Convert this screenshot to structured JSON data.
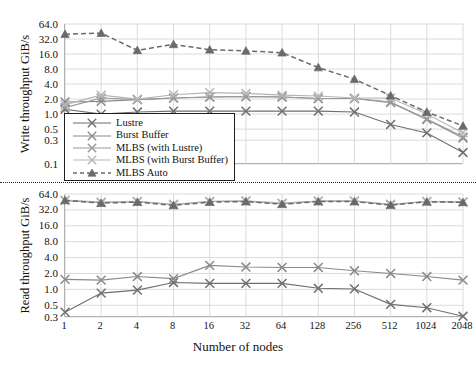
{
  "chart_data": [
    {
      "type": "line",
      "title": "",
      "xlabel": "Number of nodes",
      "ylabel": "Write throughput GiB/s",
      "xscale": "log2",
      "yscale": "log2",
      "grid": true,
      "legend_position": "inside-lower-left",
      "categories": [
        1,
        2,
        4,
        8,
        16,
        32,
        64,
        128,
        256,
        512,
        1024,
        2048
      ],
      "xtick_labels": [
        "1",
        "2",
        "4",
        "8",
        "16",
        "32",
        "64",
        "128",
        "256",
        "512",
        "1024",
        "2048"
      ],
      "ytick_labels": [
        "64.0",
        "32.0",
        "16.0",
        "8.0",
        "4.0",
        "2.0",
        "1.0",
        "0.5",
        "0.3",
        "0.1"
      ],
      "ytick_values": [
        64.0,
        32.0,
        16.0,
        8.0,
        4.0,
        2.0,
        1.0,
        0.5,
        0.3,
        0.1
      ],
      "ylim": [
        0.1,
        64.0
      ],
      "series": [
        {
          "name": "Lustre",
          "color": "#6f6f6f",
          "marker": "x",
          "dash": false,
          "values": [
            1.25,
            1.0,
            1.1,
            1.15,
            1.15,
            1.15,
            1.15,
            1.15,
            1.1,
            0.62,
            0.42,
            0.17
          ]
        },
        {
          "name": "Burst Buffer",
          "color": "#8a8a8a",
          "marker": "x",
          "dash": false,
          "values": [
            1.75,
            1.8,
            1.95,
            2.1,
            2.2,
            2.25,
            2.2,
            2.05,
            2.05,
            1.7,
            0.78,
            0.33
          ]
        },
        {
          "name": "MLBS (with Lustre)",
          "color": "#9a9a9a",
          "marker": "x",
          "dash": false,
          "values": [
            1.35,
            2.1,
            1.95,
            2.1,
            2.2,
            2.25,
            2.2,
            2.05,
            2.05,
            1.75,
            0.8,
            0.35
          ]
        },
        {
          "name": "MLBS (with Burst Buffer)",
          "color": "#b5b5b5",
          "marker": "x",
          "dash": false,
          "values": [
            1.55,
            2.4,
            2.0,
            2.45,
            2.7,
            2.6,
            2.4,
            2.3,
            2.1,
            2.1,
            1.0,
            0.42
          ]
        },
        {
          "name": "MLBS Auto",
          "color": "#6a6a6a",
          "marker": "triangle",
          "dash": true,
          "values": [
            40.0,
            42.0,
            19.0,
            25.0,
            19.5,
            18.5,
            17.0,
            8.6,
            5.0,
            2.35,
            1.1,
            0.58
          ]
        }
      ]
    },
    {
      "type": "line",
      "title": "",
      "xlabel": "Number of nodes",
      "ylabel": "Read throughput GiB/s",
      "xscale": "log2",
      "yscale": "log2",
      "grid": true,
      "legend_position": "shared-with-top-chart",
      "categories": [
        1,
        2,
        4,
        8,
        16,
        32,
        64,
        128,
        256,
        512,
        1024,
        2048
      ],
      "xtick_labels": [
        "1",
        "2",
        "4",
        "8",
        "16",
        "32",
        "64",
        "128",
        "256",
        "512",
        "1024",
        "2048"
      ],
      "ytick_labels": [
        "64.0",
        "32.0",
        "16.0",
        "8.0",
        "4.0",
        "2.0",
        "1.0",
        "0.5",
        "0.3"
      ],
      "ytick_values": [
        64.0,
        32.0,
        16.0,
        8.0,
        4.0,
        2.0,
        1.0,
        0.5,
        0.3
      ],
      "ylim": [
        0.3,
        64.0
      ],
      "series": [
        {
          "name": "Lustre",
          "color": "#6f6f6f",
          "marker": "x",
          "dash": false,
          "values": [
            0.37,
            0.85,
            0.97,
            1.35,
            1.3,
            1.3,
            1.3,
            1.05,
            1.02,
            0.52,
            0.45,
            0.31
          ]
        },
        {
          "name": "Burst Buffer",
          "color": "#8a8a8a",
          "marker": "x",
          "dash": false,
          "values": [
            1.55,
            1.5,
            1.75,
            1.6,
            2.85,
            2.65,
            2.6,
            2.6,
            2.25,
            2.0,
            1.75,
            1.5
          ]
        },
        {
          "name": "MLBS (with Lustre)",
          "color": "#9a9a9a",
          "marker": "x",
          "dash": false,
          "values": [
            48.0,
            44.0,
            46.0,
            40.0,
            46.0,
            47.0,
            42.0,
            47.0,
            47.0,
            40.0,
            46.0,
            45.0
          ]
        },
        {
          "name": "MLBS (with Burst Buffer)",
          "color": "#b5b5b5",
          "marker": "x",
          "dash": false,
          "values": [
            49.0,
            45.0,
            46.5,
            41.0,
            46.5,
            47.5,
            43.0,
            47.0,
            47.5,
            41.0,
            46.5,
            45.5
          ]
        },
        {
          "name": "MLBS Auto",
          "color": "#6a6a6a",
          "marker": "triangle",
          "dash": true,
          "values": [
            48.5,
            43.0,
            45.0,
            39.0,
            45.0,
            46.0,
            41.0,
            46.0,
            46.0,
            39.5,
            45.5,
            44.5
          ]
        }
      ]
    }
  ],
  "legend": {
    "items": [
      {
        "label": "Lustre"
      },
      {
        "label": "Burst Buffer"
      },
      {
        "label": "MLBS (with Lustre)"
      },
      {
        "label": "MLBS (with Burst Buffer)"
      },
      {
        "label": "MLBS Auto"
      }
    ]
  }
}
